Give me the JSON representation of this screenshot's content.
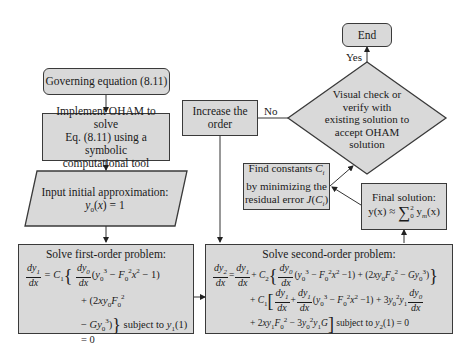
{
  "nodes": {
    "start": {
      "label": "Governing equation (8.11)"
    },
    "implement": {
      "lines": [
        "Implement OHAM to solve",
        "Eq. (8.11) using a symbolic",
        "computational tool"
      ]
    },
    "input": {
      "lines": [
        "Input initial approximation:",
        "y0(x) = 1"
      ]
    },
    "first_order": {
      "title": "Solve first-order problem:",
      "eq_line1": "dy1/dx = C1 { dy0/dx (y0^3 − F0^2 x^2 − 1)",
      "eq_line2": "+ (2xy0F0^2",
      "eq_line3": "− Gy0^3) } subject to y1(1) = 0",
      "condition": "subject to y1(1) = 0"
    },
    "second_order": {
      "title": "Solve second-order problem:",
      "eq_line1": "dy2/dx = dy1/dx + C2 { dy0/dx (y0^3 − F0^2x^2 −1) + (2xy0F0^2 − Gy0^3) }",
      "eq_line2": "+ C1 [ dy1/dx + dy1/dx (y0^3 − F0^2x^2 −1) + 3y0^2y1 dy0/dx",
      "eq_line3": "+ 2xy1F0^2 − 3y0^2y1G ] subject to y2(1) = 0",
      "condition": "subject to y2(1) = 0"
    },
    "increase": {
      "lines": [
        "Increase the",
        "order"
      ]
    },
    "decision": {
      "lines": [
        "Visual check or",
        "verify with",
        "existing solution to",
        "accept OHAM",
        "solution"
      ]
    },
    "find_constants": {
      "lines": [
        "Find constants Ci",
        "by minimizing the",
        "residual error J(Ci)"
      ]
    },
    "final_solution": {
      "title": "Final solution:",
      "formula": "y(x) ≈ Σ₀² ym(x)"
    },
    "end": {
      "label": "End"
    }
  },
  "edge_labels": {
    "yes": "Yes",
    "no": "No"
  },
  "colors": {
    "box_fill": "#d9d9d9",
    "stroke": "#3a3a3a",
    "background": "#ffffff"
  }
}
